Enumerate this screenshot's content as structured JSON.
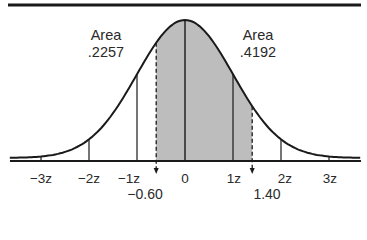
{
  "diagram": {
    "type": "normal-distribution-shaded-area",
    "mean_label": "0",
    "left_area": {
      "title": "Area",
      "value": ".2257"
    },
    "right_area": {
      "title": "Area",
      "value": ".4192"
    },
    "tick_labels": [
      "−3z",
      "−2z",
      "−1z",
      "0",
      "1z",
      "2z",
      "3z"
    ],
    "tick_values": [
      -3,
      -2,
      -1,
      0,
      1,
      2,
      3
    ],
    "bounds": {
      "lower": "−0.60",
      "upper": "1.40",
      "lower_value": -0.6,
      "upper_value": 1.4
    },
    "colors": {
      "line": "#1a1a1a",
      "shade": "#bdbdbd",
      "background": "#ffffff"
    }
  }
}
